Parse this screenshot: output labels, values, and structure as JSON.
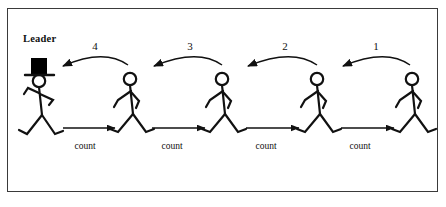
{
  "figure": {
    "title_label": "Leader",
    "background_color": "#ffffff",
    "ink_color": "#111111",
    "frame_color": "#3a3a3a",
    "leader": {
      "label": "Leader",
      "hat_color": "#000000",
      "hat_icon": "top-hat-icon",
      "position_x": 40
    },
    "walkers": [
      {
        "id": "walker-1",
        "position_x": 130
      },
      {
        "id": "walker-2",
        "position_x": 222
      },
      {
        "id": "walker-3",
        "position_x": 317
      },
      {
        "id": "walker-4",
        "position_x": 412
      }
    ],
    "curved_arrows": [
      {
        "label": "4",
        "label_x": 95,
        "label_y": 40,
        "from_x": 130,
        "to_x": 62
      },
      {
        "label": "3",
        "label_x": 190,
        "label_y": 40,
        "from_x": 224,
        "to_x": 152
      },
      {
        "label": "2",
        "label_x": 285,
        "label_y": 40,
        "from_x": 319,
        "to_x": 246
      },
      {
        "label": "1",
        "label_x": 376,
        "label_y": 40,
        "from_x": 412,
        "to_x": 341
      }
    ],
    "straight_arrows": [
      {
        "label": "count",
        "label_x": 85,
        "label_y": 141,
        "from_x": 62,
        "to_x": 116
      },
      {
        "label": "count",
        "label_x": 172,
        "label_y": 141,
        "from_x": 152,
        "to_x": 206
      },
      {
        "label": "count",
        "label_x": 266,
        "label_y": 141,
        "from_x": 246,
        "to_x": 300
      },
      {
        "label": "count",
        "label_x": 360,
        "label_y": 141,
        "from_x": 341,
        "to_x": 395
      }
    ]
  }
}
